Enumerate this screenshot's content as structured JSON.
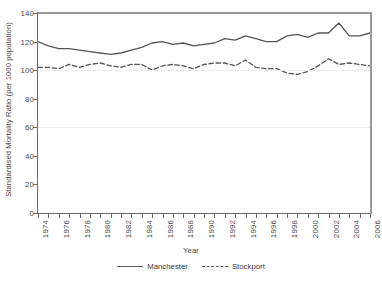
{
  "chart_data": {
    "type": "line",
    "title": "",
    "xlabel": "Year",
    "ylabel": "Standardised Mortality Ratio (per 1000 population)",
    "xlim": [
      1974,
      2006
    ],
    "ylim": [
      0,
      140
    ],
    "yticks": [
      0,
      20,
      40,
      60,
      80,
      100,
      120,
      140
    ],
    "xticks": [
      1974,
      1975,
      1976,
      1977,
      1978,
      1979,
      1980,
      1981,
      1982,
      1983,
      1984,
      1985,
      1986,
      1987,
      1988,
      1989,
      1990,
      1991,
      1992,
      1993,
      1994,
      1995,
      1996,
      1997,
      1998,
      1999,
      2000,
      2001,
      2002,
      2003,
      2004,
      2005,
      2006
    ],
    "xtick_labels": [
      "1974",
      "",
      "1976",
      "",
      "1978",
      "",
      "1980",
      "",
      "1982",
      "",
      "1984",
      "",
      "1986",
      "",
      "1988",
      "",
      "1990",
      "",
      "1992",
      "",
      "1994",
      "",
      "1996",
      "",
      "1998",
      "",
      "2000",
      "",
      "2002",
      "",
      "2004",
      "",
      "2006"
    ],
    "grid": "horizontal-light",
    "legend_position": "bottom-center",
    "x": [
      1974,
      1975,
      1976,
      1977,
      1978,
      1979,
      1980,
      1981,
      1982,
      1983,
      1984,
      1985,
      1986,
      1987,
      1988,
      1989,
      1990,
      1991,
      1992,
      1993,
      1994,
      1995,
      1996,
      1997,
      1998,
      1999,
      2000,
      2001,
      2002,
      2003,
      2004,
      2005,
      2006
    ],
    "series": [
      {
        "name": "Manchester",
        "style": "solid",
        "color": "#555555",
        "values": [
          120,
          117,
          115,
          115,
          114,
          113,
          112,
          111,
          112,
          114,
          116,
          119,
          120,
          118,
          119,
          117,
          118,
          119,
          122,
          121,
          124,
          122,
          120,
          120,
          124,
          125,
          123,
          126,
          126,
          133,
          124,
          124,
          126
        ]
      },
      {
        "name": "Stockport",
        "style": "dashed",
        "color": "#555555",
        "values": [
          102,
          102,
          101,
          104,
          102,
          104,
          105,
          103,
          102,
          104,
          104,
          100,
          103,
          104,
          103,
          101,
          104,
          105,
          105,
          103,
          107,
          102,
          101,
          101,
          98,
          97,
          99,
          103,
          108,
          104,
          105,
          104,
          103
        ]
      }
    ]
  },
  "legend": {
    "entries": [
      {
        "label": "Manchester",
        "style": "solid"
      },
      {
        "label": "Stockport",
        "style": "dashed"
      }
    ]
  },
  "axes": {
    "y_title": "Standardised Mortality Ratio (per 1000 population)",
    "x_title": "Year"
  }
}
